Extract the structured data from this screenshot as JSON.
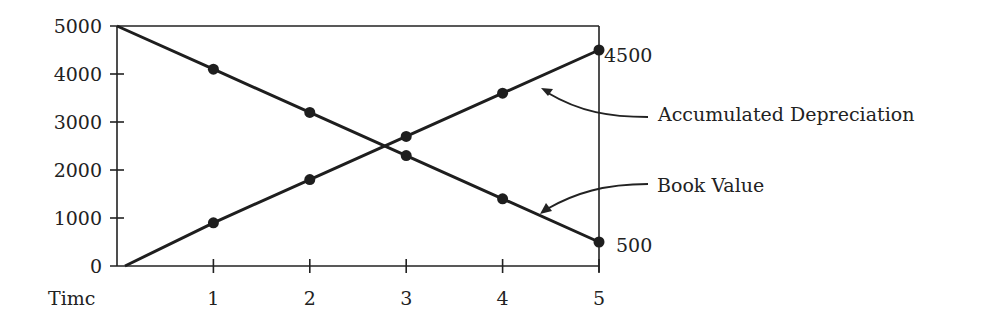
{
  "chart_data": {
    "type": "line",
    "title": "",
    "xlabel": "Timc",
    "ylabel": "",
    "x": [
      0,
      1,
      2,
      3,
      4,
      5
    ],
    "x_tick_labels": [
      "1",
      "2",
      "3",
      "4",
      "5"
    ],
    "y_tick_labels": [
      "0",
      "1000",
      "2000",
      "3000",
      "4000",
      "5000"
    ],
    "xlim": [
      0,
      5
    ],
    "ylim": [
      0,
      5000
    ],
    "grid": false,
    "legend_position": "none",
    "series": [
      {
        "name": "Book Value",
        "values": [
          5000,
          4100,
          3200,
          2300,
          1400,
          500
        ],
        "markers_at": [
          1,
          2,
          3,
          4,
          5
        ]
      },
      {
        "name": "Accumulated Depreciation",
        "values": [
          0,
          900,
          1800,
          2700,
          3600,
          4500
        ],
        "markers_at": [
          1,
          2,
          3,
          4,
          5
        ]
      }
    ],
    "annotations": [
      {
        "text": "Accumulated Depreciation",
        "points_to": "Accumulated Depreciation"
      },
      {
        "text": "Book Value",
        "points_to": "Book Value"
      },
      {
        "text": "4500",
        "at": [
          5,
          4500
        ]
      },
      {
        "text": "500",
        "at": [
          5,
          500
        ]
      }
    ]
  },
  "colors": {
    "ink": "#1e1e1e",
    "background": "#ffffff"
  }
}
